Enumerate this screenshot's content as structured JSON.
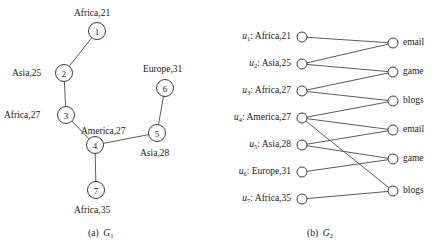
{
  "figure": {
    "panel_a": {
      "caption_prefix": "(a)",
      "caption_symbol": "G",
      "caption_subscript": "1",
      "graph_type": "undirected-tree",
      "nodes": [
        {
          "id": "1",
          "label": "Africa,21",
          "cx": 97,
          "cy": 31,
          "r": 8.5,
          "label_x": 74,
          "label_y": 9,
          "align": "left"
        },
        {
          "id": "2",
          "label": "Asia,25",
          "cx": 64,
          "cy": 73,
          "r": 8.5,
          "label_x": 12,
          "label_y": 69,
          "align": "left"
        },
        {
          "id": "3",
          "label": "Africa,27",
          "cx": 66,
          "cy": 115,
          "r": 8.5,
          "label_x": 4,
          "label_y": 111,
          "align": "left"
        },
        {
          "id": "4",
          "label": "America,27",
          "cx": 95,
          "cy": 145,
          "r": 8.5,
          "label_x": 81,
          "label_y": 127,
          "align": "left"
        },
        {
          "id": "5",
          "label": "Asia,28",
          "cx": 157,
          "cy": 133,
          "r": 8.5,
          "label_x": 140,
          "label_y": 149,
          "align": "left"
        },
        {
          "id": "6",
          "label": "Europe,31",
          "cx": 165,
          "cy": 88,
          "r": 8.5,
          "label_x": 143,
          "label_y": 65,
          "align": "left"
        },
        {
          "id": "7",
          "label": "Africa,35",
          "cx": 96,
          "cy": 190,
          "r": 8.5,
          "label_x": 74,
          "label_y": 206,
          "align": "left"
        }
      ],
      "edges": [
        {
          "from": "1",
          "to": "2"
        },
        {
          "from": "2",
          "to": "3"
        },
        {
          "from": "3",
          "to": "4"
        },
        {
          "from": "4",
          "to": "5"
        },
        {
          "from": "5",
          "to": "6"
        },
        {
          "from": "4",
          "to": "7"
        }
      ]
    },
    "panel_b": {
      "caption_prefix": "(b)",
      "caption_symbol": "G",
      "caption_subscript": "2",
      "graph_type": "bipartite",
      "left_nodes": [
        {
          "key": "u1",
          "var": "u",
          "sub": "1",
          "label": "Africa,21",
          "cx": 302,
          "cy": 37,
          "r": 5
        },
        {
          "key": "u2",
          "var": "u",
          "sub": "2",
          "label": "Asia,25",
          "cx": 302,
          "cy": 64,
          "r": 5
        },
        {
          "key": "u3",
          "var": "u",
          "sub": "3",
          "label": "Africa,27",
          "cx": 302,
          "cy": 91,
          "r": 5
        },
        {
          "key": "u4",
          "var": "u",
          "sub": "4",
          "label": "America,27",
          "cx": 302,
          "cy": 118,
          "r": 5
        },
        {
          "key": "u5",
          "var": "u",
          "sub": "5",
          "label": "Asia,28",
          "cx": 302,
          "cy": 145,
          "r": 5
        },
        {
          "key": "u6",
          "var": "u",
          "sub": "6",
          "label": "Europe,31",
          "cx": 302,
          "cy": 172,
          "r": 5
        },
        {
          "key": "u7",
          "var": "u",
          "sub": "7",
          "label": "Africa,35",
          "cx": 302,
          "cy": 199,
          "r": 5
        }
      ],
      "right_nodes": [
        {
          "key": "v1",
          "label": "email",
          "cx": 393,
          "cy": 43,
          "r": 5
        },
        {
          "key": "v2",
          "label": "game",
          "cx": 393,
          "cy": 72,
          "r": 5
        },
        {
          "key": "v3",
          "label": "blogs",
          "cx": 393,
          "cy": 101,
          "r": 5
        },
        {
          "key": "v4",
          "label": "email",
          "cx": 393,
          "cy": 130,
          "r": 5
        },
        {
          "key": "v5",
          "label": "game",
          "cx": 393,
          "cy": 159,
          "r": 5
        },
        {
          "key": "v6",
          "label": "blogs",
          "cx": 393,
          "cy": 191,
          "r": 5
        }
      ],
      "edges": [
        {
          "from": "u1",
          "to": "v1"
        },
        {
          "from": "u2",
          "to": "v1"
        },
        {
          "from": "u2",
          "to": "v2"
        },
        {
          "from": "u3",
          "to": "v2"
        },
        {
          "from": "u3",
          "to": "v3"
        },
        {
          "from": "u4",
          "to": "v3"
        },
        {
          "from": "u4",
          "to": "v4"
        },
        {
          "from": "u4",
          "to": "v6"
        },
        {
          "from": "u5",
          "to": "v4"
        },
        {
          "from": "u5",
          "to": "v5"
        },
        {
          "from": "u6",
          "to": "v5"
        },
        {
          "from": "u7",
          "to": "v6"
        }
      ]
    },
    "colors": {
      "stroke": "#4a4a4a",
      "node_stroke": "#3c3c3c",
      "node_fill": "#ffffff",
      "text": "#1a1a1a",
      "background": "#ffffff"
    }
  }
}
